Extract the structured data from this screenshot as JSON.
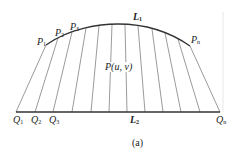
{
  "figure": {
    "caption": "(a)",
    "curve_label": {
      "main": "L",
      "sub": "1"
    },
    "base_label": {
      "main": "L",
      "sub": "2"
    },
    "point_label": "P(u,  v)",
    "top_points": [
      {
        "main": "P",
        "sub": "1"
      },
      {
        "main": "P",
        "sub": "2"
      },
      {
        "main": "P",
        "sub": "3"
      },
      {
        "main": "P",
        "sub": "n"
      }
    ],
    "bottom_points": [
      {
        "main": "Q",
        "sub": "1"
      },
      {
        "main": "Q",
        "sub": "2"
      },
      {
        "main": "Q",
        "sub": "3"
      },
      {
        "main": "Q",
        "sub": "n"
      }
    ],
    "colors": {
      "line": "#333333",
      "ruling": "#555555",
      "background": "#ffffff"
    }
  }
}
